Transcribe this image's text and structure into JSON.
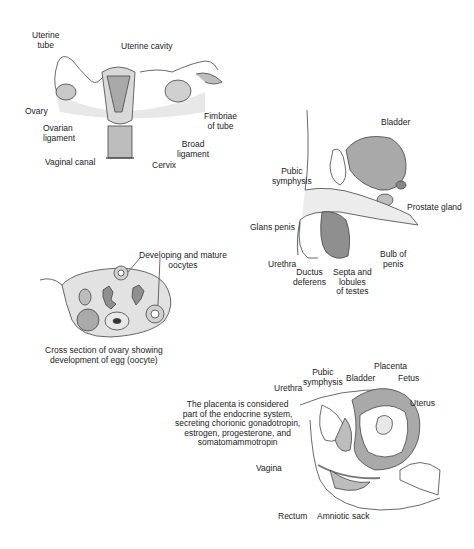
{
  "female_reproductive": {
    "labels": {
      "uterine_tube": "Uterine\ntube",
      "uterine_tube_l1": "Uterine",
      "uterine_tube_l2": "tube",
      "uterine_cavity": "Uterine cavity",
      "ovary": "Ovary",
      "ovarian_ligament_l1": "Ovarian",
      "ovarian_ligament_l2": "ligament",
      "fimbriae_l1": "Fimbriae",
      "fimbriae_l2": "of tube",
      "broad_ligament_l1": "Broad",
      "broad_ligament_l2": "ligament",
      "vaginal_canal": "Vaginal canal",
      "cervix": "Cervix"
    }
  },
  "male_reproductive": {
    "labels": {
      "bladder": "Bladder",
      "pubic_symphysis_l1": "Pubic",
      "pubic_symphysis_l2": "symphysis",
      "prostate_gland": "Prostate gland",
      "glans_penis": "Glans penis",
      "urethra": "Urethra",
      "ductus_l1": "Ductus",
      "ductus_l2": "deferens",
      "septa_l1": "Septa and",
      "septa_l2": "lobules",
      "septa_l3": "of testes",
      "bulb_l1": "Bulb of",
      "bulb_l2": "penis"
    }
  },
  "ovary_cross_section": {
    "labels": {
      "oocytes_l1": "Developing and mature",
      "oocytes_l2": "oocytes"
    },
    "caption_l1": "Cross section of ovary showing",
    "caption_l2": "development of egg (oocyte)"
  },
  "pregnancy": {
    "labels": {
      "pubic_symphysis_l1": "Pubic",
      "pubic_symphysis_l2": "symphysis",
      "bladder": "Bladder",
      "placenta": "Placenta",
      "fetus": "Fetus",
      "urethra": "Urethra",
      "uterus": "Uterus",
      "vagina": "Vagina",
      "rectum": "Rectum",
      "amniotic_sack": "Amniotic sack"
    },
    "note_l1": "The placenta is considered",
    "note_l2": "part of the endocrine system,",
    "note_l3": "secreting chorionic gonadotropin,",
    "note_l4": "estrogen, progesterone, and",
    "note_l5": "somatomammotropin"
  },
  "colors": {
    "tissue_light": "#e6e6e6",
    "tissue_mid": "#bdbdbd",
    "tissue_dark": "#8f8f8f",
    "line": "#333333"
  }
}
